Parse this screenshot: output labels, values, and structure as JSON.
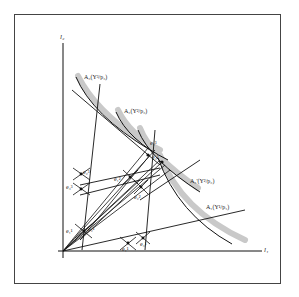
{
  "diagram": {
    "axes": {
      "y_label": "l₂",
      "x_label": "l₁"
    },
    "curves": [
      {
        "id": "A3",
        "label": "A₃(Y³/p₃)"
      },
      {
        "id": "A2",
        "label": "A₂(Y²/p₂)"
      },
      {
        "id": "A2p",
        "label": "A₂'(Y²/p₂)"
      },
      {
        "id": "A1",
        "label": "A₁(Y¹/p₁)"
      }
    ],
    "points": [
      {
        "id": "e2a",
        "label": "e₂³"
      },
      {
        "id": "e3a",
        "label": "e₃³"
      },
      {
        "id": "e1a",
        "label": "e₁²"
      },
      {
        "id": "e2b",
        "label": "e₂²"
      },
      {
        "id": "e3b",
        "label": "e₃²"
      },
      {
        "id": "e1b",
        "label": "e₁¹"
      },
      {
        "id": "e2c",
        "label": "e₂¹"
      },
      {
        "id": "e3c",
        "label": "e₃¹"
      },
      {
        "id": "e1c",
        "label": "e₁¹"
      },
      {
        "id": "e1d",
        "label": "e₁³"
      }
    ],
    "colors": {
      "line": "#111111",
      "highlight": "#c8c8c8",
      "frame": "#444444"
    }
  }
}
